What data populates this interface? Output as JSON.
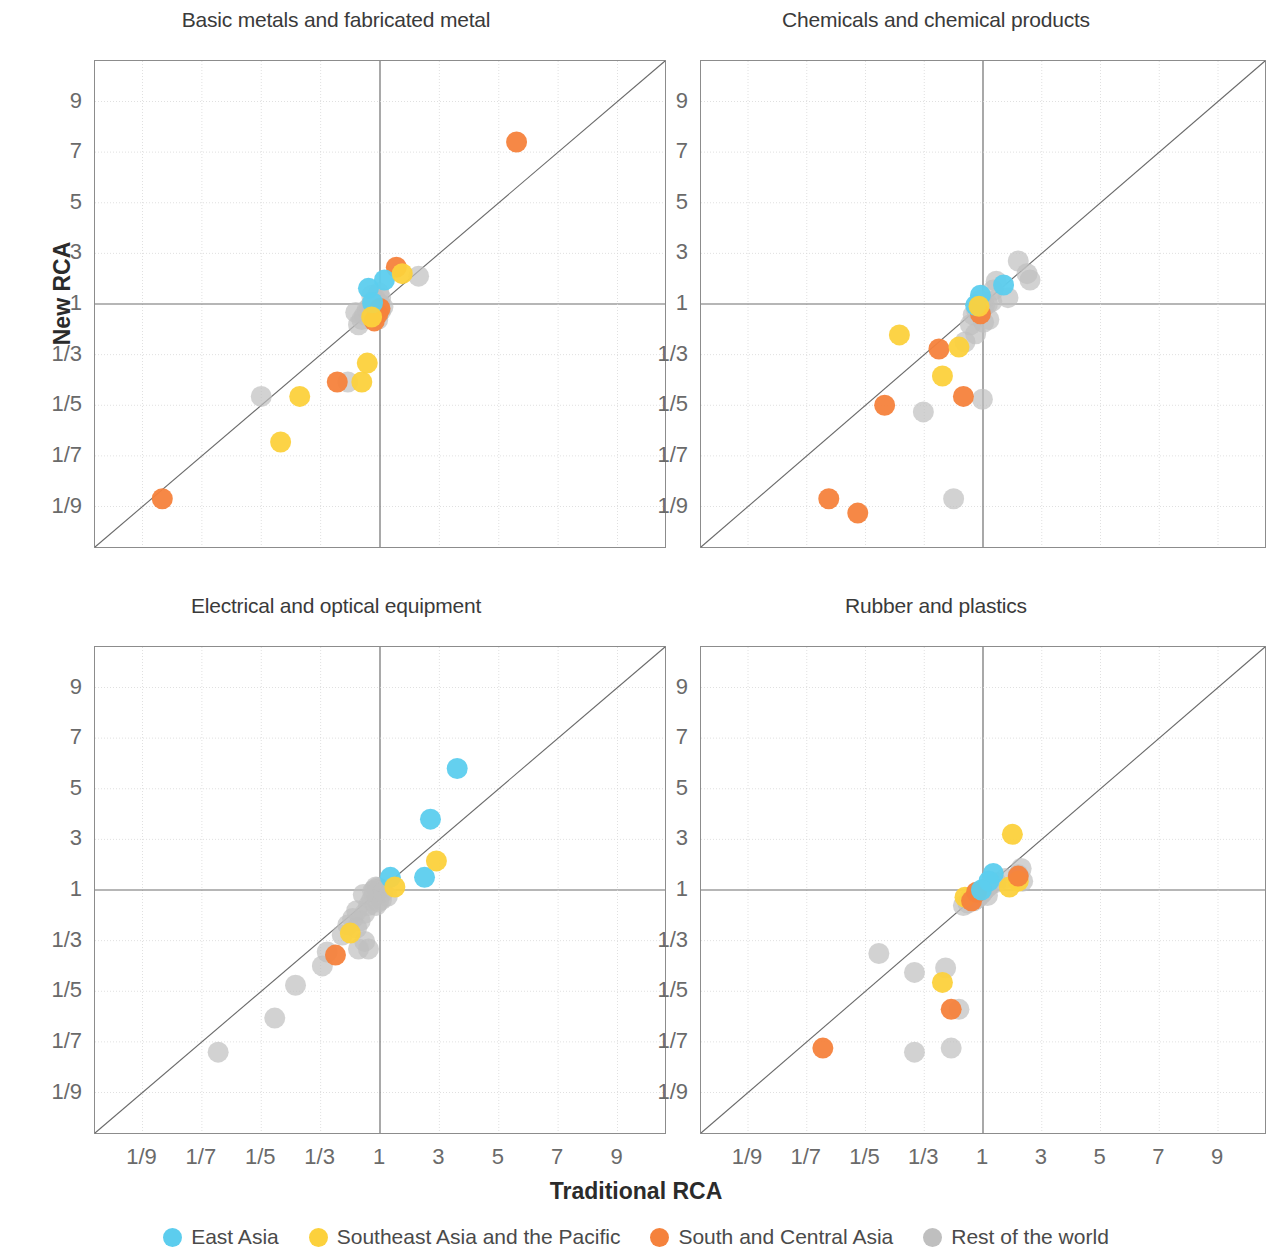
{
  "axis_titles": {
    "x": "Traditional RCA",
    "y": "New RCA"
  },
  "legend": [
    {
      "label": "East Asia",
      "color": "#5CCDEE",
      "key": "east_asia"
    },
    {
      "label": "Southeast Asia and the Pacific",
      "color": "#FCD13C",
      "key": "southeast_asia"
    },
    {
      "label": "South and Central Asia",
      "color": "#F5823C",
      "key": "south_central_asia"
    },
    {
      "label": "Rest of the world",
      "color": "#BFBFBF",
      "key": "rest_of_world"
    }
  ],
  "tick_labels": {
    "x": [
      "1/9",
      "1/7",
      "1/5",
      "1/3",
      "1",
      "3",
      "5",
      "7",
      "9"
    ],
    "y": [
      "9",
      "7",
      "5",
      "3",
      "1",
      "1/3",
      "1/5",
      "1/7",
      "1/9"
    ]
  },
  "chart_data": {
    "type": "scatter",
    "title": "",
    "xlabel": "Traditional RCA",
    "ylabel": "New RCA",
    "scale": "symmetric-reciprocal-log",
    "xlim": [
      0.1,
      10
    ],
    "ylim": [
      0.1,
      10
    ],
    "xticks": [
      "1/9",
      "1/7",
      "1/5",
      "1/3",
      "1",
      "3",
      "5",
      "7",
      "9"
    ],
    "yticks": [
      "9",
      "7",
      "5",
      "3",
      "1",
      "1/3",
      "1/5",
      "1/7",
      "1/9"
    ],
    "grid": true,
    "legend_position": "bottom",
    "reference_line": "y = x (45 degree diagonal)",
    "series_colors": {
      "East Asia": "#5CCDEE",
      "Southeast Asia and the Pacific": "#FCD13C",
      "South and Central Asia": "#F5823C",
      "Rest of the world": "#BFBFBF"
    },
    "panels": [
      {
        "title": "Basic metals and fabricated metal",
        "points": [
          {
            "g": "south_central_asia",
            "x": 5.6,
            "y": 7.4
          },
          {
            "g": "south_central_asia",
            "x": 1.55,
            "y": 2.45
          },
          {
            "g": "south_central_asia",
            "x": 0.41,
            "y": 0.245
          },
          {
            "g": "south_central_asia",
            "x": 1.0,
            "y": 0.85
          },
          {
            "g": "south_central_asia",
            "x": 0.93,
            "y": 0.72
          },
          {
            "g": "south_central_asia",
            "x": 0.84,
            "y": 0.6
          },
          {
            "g": "south_central_asia",
            "x": 0.12,
            "y": 0.115
          },
          {
            "g": "east_asia",
            "x": 1.15,
            "y": 1.95
          },
          {
            "g": "east_asia",
            "x": 0.72,
            "y": 1.62
          },
          {
            "g": "east_asia",
            "x": 0.8,
            "y": 1.05
          },
          {
            "g": "southeast_asia",
            "x": 1.75,
            "y": 2.2
          },
          {
            "g": "southeast_asia",
            "x": 0.62,
            "y": 0.245
          },
          {
            "g": "southeast_asia",
            "x": 0.78,
            "y": 0.66
          },
          {
            "g": "southeast_asia",
            "x": 0.7,
            "y": 0.3
          },
          {
            "g": "southeast_asia",
            "x": 0.27,
            "y": 0.215
          },
          {
            "g": "southeast_asia",
            "x": 0.23,
            "y": 0.155
          },
          {
            "g": "rest_of_world",
            "x": 2.3,
            "y": 2.1
          },
          {
            "g": "rest_of_world",
            "x": 1.0,
            "y": 1.0
          },
          {
            "g": "rest_of_world",
            "x": 1.1,
            "y": 0.9
          },
          {
            "g": "rest_of_world",
            "x": 0.88,
            "y": 0.95
          },
          {
            "g": "rest_of_world",
            "x": 1.02,
            "y": 0.78
          },
          {
            "g": "rest_of_world",
            "x": 0.95,
            "y": 0.72
          },
          {
            "g": "rest_of_world",
            "x": 0.8,
            "y": 0.78
          },
          {
            "g": "rest_of_world",
            "x": 0.9,
            "y": 1.1
          },
          {
            "g": "rest_of_world",
            "x": 0.86,
            "y": 1.22
          },
          {
            "g": "rest_of_world",
            "x": 0.78,
            "y": 1.35
          },
          {
            "g": "rest_of_world",
            "x": 0.74,
            "y": 0.9
          },
          {
            "g": "rest_of_world",
            "x": 0.7,
            "y": 0.82
          },
          {
            "g": "rest_of_world",
            "x": 0.66,
            "y": 0.7
          },
          {
            "g": "rest_of_world",
            "x": 0.62,
            "y": 0.62
          },
          {
            "g": "rest_of_world",
            "x": 0.58,
            "y": 0.55
          },
          {
            "g": "rest_of_world",
            "x": 0.55,
            "y": 0.75
          },
          {
            "g": "rest_of_world",
            "x": 0.93,
            "y": 0.62
          },
          {
            "g": "rest_of_world",
            "x": 0.48,
            "y": 0.245
          },
          {
            "g": "rest_of_world",
            "x": 0.2,
            "y": 0.215
          },
          {
            "g": "rest_of_world",
            "x": 1.02,
            "y": 1.25
          },
          {
            "g": "rest_of_world",
            "x": 0.96,
            "y": 1.45
          }
        ]
      },
      {
        "title": "Chemicals and chemical products",
        "points": [
          {
            "g": "south_central_asia",
            "x": 0.4,
            "y": 0.36
          },
          {
            "g": "south_central_asia",
            "x": 0.6,
            "y": 0.215
          },
          {
            "g": "south_central_asia",
            "x": 0.92,
            "y": 0.72
          },
          {
            "g": "south_central_asia",
            "x": 0.23,
            "y": 0.2
          },
          {
            "g": "south_central_asia",
            "x": 0.16,
            "y": 0.115
          },
          {
            "g": "south_central_asia",
            "x": 0.19,
            "y": 0.108
          },
          {
            "g": "east_asia",
            "x": 0.92,
            "y": 1.35
          },
          {
            "g": "east_asia",
            "x": 1.7,
            "y": 1.75
          },
          {
            "g": "east_asia",
            "x": 0.8,
            "y": 0.95
          },
          {
            "g": "southeast_asia",
            "x": 0.26,
            "y": 0.45
          },
          {
            "g": "southeast_asia",
            "x": 0.55,
            "y": 0.37
          },
          {
            "g": "southeast_asia",
            "x": 0.42,
            "y": 0.26
          },
          {
            "g": "southeast_asia",
            "x": 0.88,
            "y": 0.92
          },
          {
            "g": "rest_of_world",
            "x": 2.2,
            "y": 2.7
          },
          {
            "g": "rest_of_world",
            "x": 2.5,
            "y": 2.2
          },
          {
            "g": "rest_of_world",
            "x": 2.6,
            "y": 1.95
          },
          {
            "g": "rest_of_world",
            "x": 1.45,
            "y": 1.9
          },
          {
            "g": "rest_of_world",
            "x": 1.85,
            "y": 1.25
          },
          {
            "g": "rest_of_world",
            "x": 1.3,
            "y": 1.1
          },
          {
            "g": "rest_of_world",
            "x": 1.15,
            "y": 1.0
          },
          {
            "g": "rest_of_world",
            "x": 1.05,
            "y": 0.95
          },
          {
            "g": "rest_of_world",
            "x": 1.0,
            "y": 0.88
          },
          {
            "g": "rest_of_world",
            "x": 0.95,
            "y": 0.82
          },
          {
            "g": "rest_of_world",
            "x": 0.9,
            "y": 0.9
          },
          {
            "g": "rest_of_world",
            "x": 0.82,
            "y": 0.8
          },
          {
            "g": "rest_of_world",
            "x": 0.75,
            "y": 0.7
          },
          {
            "g": "rest_of_world",
            "x": 1.2,
            "y": 0.62
          },
          {
            "g": "rest_of_world",
            "x": 1.02,
            "y": 0.58
          },
          {
            "g": "rest_of_world",
            "x": 0.7,
            "y": 0.55
          },
          {
            "g": "rest_of_world",
            "x": 0.62,
            "y": 0.4
          },
          {
            "g": "rest_of_world",
            "x": 0.8,
            "y": 0.46
          },
          {
            "g": "rest_of_world",
            "x": 0.98,
            "y": 0.21
          },
          {
            "g": "rest_of_world",
            "x": 0.33,
            "y": 0.19
          },
          {
            "g": "rest_of_world",
            "x": 0.5,
            "y": 0.115
          },
          {
            "g": "rest_of_world",
            "x": 0.9,
            "y": 1.15
          },
          {
            "g": "rest_of_world",
            "x": 1.35,
            "y": 1.55
          }
        ]
      },
      {
        "title": "Electrical and optical equipment",
        "points": [
          {
            "g": "east_asia",
            "x": 3.6,
            "y": 5.8
          },
          {
            "g": "east_asia",
            "x": 2.7,
            "y": 3.8
          },
          {
            "g": "east_asia",
            "x": 2.5,
            "y": 1.5
          },
          {
            "g": "east_asia",
            "x": 1.35,
            "y": 1.5
          },
          {
            "g": "southeast_asia",
            "x": 2.9,
            "y": 2.15
          },
          {
            "g": "southeast_asia",
            "x": 1.5,
            "y": 1.12
          },
          {
            "g": "southeast_asia",
            "x": 0.5,
            "y": 0.37
          },
          {
            "g": "south_central_asia",
            "x": 0.4,
            "y": 0.28
          },
          {
            "g": "rest_of_world",
            "x": 1.0,
            "y": 1.05
          },
          {
            "g": "rest_of_world",
            "x": 0.93,
            "y": 1.1
          },
          {
            "g": "rest_of_world",
            "x": 0.88,
            "y": 1.12
          },
          {
            "g": "rest_of_world",
            "x": 0.84,
            "y": 1.0
          },
          {
            "g": "rest_of_world",
            "x": 0.8,
            "y": 0.95
          },
          {
            "g": "rest_of_world",
            "x": 1.1,
            "y": 0.92
          },
          {
            "g": "rest_of_world",
            "x": 1.25,
            "y": 0.8
          },
          {
            "g": "rest_of_world",
            "x": 1.05,
            "y": 0.72
          },
          {
            "g": "rest_of_world",
            "x": 0.95,
            "y": 0.68
          },
          {
            "g": "rest_of_world",
            "x": 0.88,
            "y": 0.62
          },
          {
            "g": "rest_of_world",
            "x": 0.78,
            "y": 0.72
          },
          {
            "g": "rest_of_world",
            "x": 0.72,
            "y": 0.62
          },
          {
            "g": "rest_of_world",
            "x": 0.66,
            "y": 0.52
          },
          {
            "g": "rest_of_world",
            "x": 0.6,
            "y": 0.45
          },
          {
            "g": "rest_of_world",
            "x": 0.56,
            "y": 0.4
          },
          {
            "g": "rest_of_world",
            "x": 0.52,
            "y": 0.47
          },
          {
            "g": "rest_of_world",
            "x": 0.48,
            "y": 0.42
          },
          {
            "g": "rest_of_world",
            "x": 0.44,
            "y": 0.36
          },
          {
            "g": "rest_of_world",
            "x": 0.66,
            "y": 0.33
          },
          {
            "g": "rest_of_world",
            "x": 0.72,
            "y": 0.3
          },
          {
            "g": "rest_of_world",
            "x": 0.58,
            "y": 0.3
          },
          {
            "g": "rest_of_world",
            "x": 0.36,
            "y": 0.29
          },
          {
            "g": "rest_of_world",
            "x": 0.34,
            "y": 0.25
          },
          {
            "g": "rest_of_world",
            "x": 0.26,
            "y": 0.21
          },
          {
            "g": "rest_of_world",
            "x": 0.22,
            "y": 0.165
          },
          {
            "g": "rest_of_world",
            "x": 0.155,
            "y": 0.135
          },
          {
            "g": "rest_of_world",
            "x": 0.64,
            "y": 0.85
          },
          {
            "g": "rest_of_world",
            "x": 0.56,
            "y": 0.55
          }
        ]
      },
      {
        "title": "Rubber and plastics",
        "points": [
          {
            "g": "southeast_asia",
            "x": 2.0,
            "y": 3.2
          },
          {
            "g": "southeast_asia",
            "x": 2.2,
            "y": 1.35
          },
          {
            "g": "southeast_asia",
            "x": 1.9,
            "y": 1.12
          },
          {
            "g": "southeast_asia",
            "x": 0.62,
            "y": 0.78
          },
          {
            "g": "southeast_asia",
            "x": 0.42,
            "y": 0.215
          },
          {
            "g": "south_central_asia",
            "x": 2.2,
            "y": 1.55
          },
          {
            "g": "south_central_asia",
            "x": 0.82,
            "y": 0.92
          },
          {
            "g": "south_central_asia",
            "x": 0.72,
            "y": 0.7
          },
          {
            "g": "south_central_asia",
            "x": 0.48,
            "y": 0.175
          },
          {
            "g": "south_central_asia",
            "x": 0.155,
            "y": 0.138
          },
          {
            "g": "east_asia",
            "x": 1.35,
            "y": 1.65
          },
          {
            "g": "east_asia",
            "x": 1.2,
            "y": 1.35
          },
          {
            "g": "east_asia",
            "x": 0.95,
            "y": 1.0
          },
          {
            "g": "rest_of_world",
            "x": 2.3,
            "y": 1.85
          },
          {
            "g": "rest_of_world",
            "x": 2.2,
            "y": 1.6
          },
          {
            "g": "rest_of_world",
            "x": 2.35,
            "y": 1.35
          },
          {
            "g": "rest_of_world",
            "x": 1.75,
            "y": 1.45
          },
          {
            "g": "rest_of_world",
            "x": 1.45,
            "y": 1.3
          },
          {
            "g": "rest_of_world",
            "x": 1.25,
            "y": 1.2
          },
          {
            "g": "rest_of_world",
            "x": 1.15,
            "y": 1.1
          },
          {
            "g": "rest_of_world",
            "x": 1.05,
            "y": 1.0
          },
          {
            "g": "rest_of_world",
            "x": 1.0,
            "y": 0.92
          },
          {
            "g": "rest_of_world",
            "x": 0.95,
            "y": 0.86
          },
          {
            "g": "rest_of_world",
            "x": 0.92,
            "y": 0.95
          },
          {
            "g": "rest_of_world",
            "x": 0.88,
            "y": 0.8
          },
          {
            "g": "rest_of_world",
            "x": 0.84,
            "y": 0.75
          },
          {
            "g": "rest_of_world",
            "x": 0.8,
            "y": 0.88
          },
          {
            "g": "rest_of_world",
            "x": 0.76,
            "y": 0.7
          },
          {
            "g": "rest_of_world",
            "x": 0.7,
            "y": 0.78
          },
          {
            "g": "rest_of_world",
            "x": 0.66,
            "y": 0.66
          },
          {
            "g": "rest_of_world",
            "x": 0.6,
            "y": 0.62
          },
          {
            "g": "rest_of_world",
            "x": 1.15,
            "y": 0.82
          },
          {
            "g": "rest_of_world",
            "x": 0.22,
            "y": 0.285
          },
          {
            "g": "rest_of_world",
            "x": 0.3,
            "y": 0.235
          },
          {
            "g": "rest_of_world",
            "x": 0.44,
            "y": 0.245
          },
          {
            "g": "rest_of_world",
            "x": 0.55,
            "y": 0.175
          },
          {
            "g": "rest_of_world",
            "x": 0.3,
            "y": 0.135
          },
          {
            "g": "rest_of_world",
            "x": 0.48,
            "y": 0.138
          }
        ]
      }
    ]
  }
}
